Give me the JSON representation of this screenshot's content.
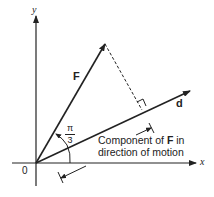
{
  "diagram": {
    "axes": {
      "x_label": "x",
      "y_label": "y",
      "origin_label": "0"
    },
    "vectors": {
      "force_label": "F",
      "displacement_label": "d"
    },
    "angle": {
      "numerator": "π",
      "denominator": "3"
    },
    "caption": {
      "line1_pre": "Component of ",
      "line1_bold": "F",
      "line1_post": " in",
      "line2": "direction of motion"
    },
    "colors": {
      "stroke": "#222222",
      "background": "#ffffff"
    }
  }
}
